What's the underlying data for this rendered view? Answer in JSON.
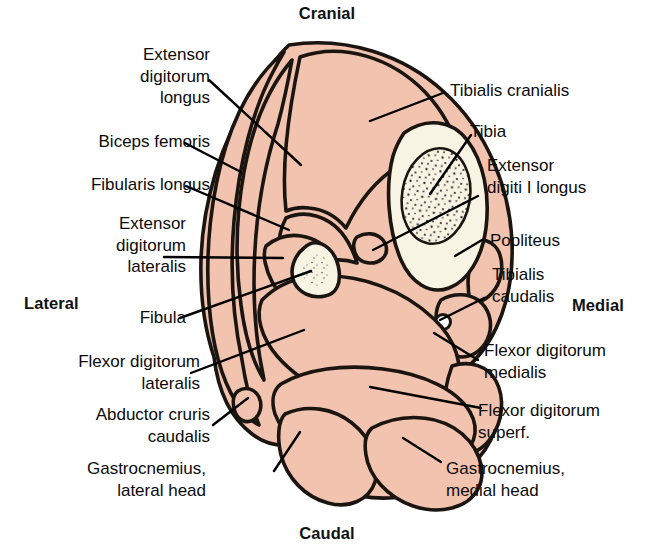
{
  "figure": {
    "kind": "anatomical-cross-section"
  },
  "orientation": {
    "cranial": "Cranial",
    "caudal": "Caudal",
    "lateral": "Lateral",
    "medial": "Medial"
  },
  "colors": {
    "muscle_fill": "#f2c3ae",
    "bone_cortex": "#f7f3e2",
    "bone_marrow": "#f7f3e2",
    "outline": "#1b1512",
    "background": "#ffffff",
    "text": "#0b0b0b",
    "leader_line": "#000000"
  },
  "labels_left": [
    {
      "id": "extensor-digitorum-longus",
      "text": "Extensor\ndigitorum\nlongus"
    },
    {
      "id": "biceps-femoris",
      "text": "Biceps femoris"
    },
    {
      "id": "fibularis-longus",
      "text": "Fibularis longus"
    },
    {
      "id": "extensor-digitorum-lateralis",
      "text": "Extensor\ndigitorum\nlateralis"
    },
    {
      "id": "fibula",
      "text": "Fibula"
    },
    {
      "id": "flexor-digitorum-lateralis",
      "text": "Flexor digitorum\nlateralis"
    },
    {
      "id": "abductor-cruris-caudalis",
      "text": "Abductor cruris\ncaudalis"
    },
    {
      "id": "gastrocnemius-lateral-head",
      "text": "Gastrocnemius,\nlateral head"
    }
  ],
  "labels_right": [
    {
      "id": "tibialis-cranialis",
      "text": "Tibialis cranialis"
    },
    {
      "id": "tibia",
      "text": "Tibia"
    },
    {
      "id": "extensor-digiti-i-longus",
      "text": "Extensor\ndigiti I longus"
    },
    {
      "id": "popliteus",
      "text": "Popliteus"
    },
    {
      "id": "tibialis-caudalis",
      "text": "Tibialis\ncaudalis"
    },
    {
      "id": "flexor-digitorum-medialis",
      "text": "Flexor digitorum\nmedialis"
    },
    {
      "id": "flexor-digitorum-superf",
      "text": "Flexor digitorum\nsuperf."
    },
    {
      "id": "gastrocnemius-medial-head",
      "text": "Gastrocnemius,\nmedial head"
    }
  ],
  "structures": [
    {
      "id": "tibia",
      "type": "bone",
      "side": "medial-cranial"
    },
    {
      "id": "fibula",
      "type": "bone",
      "side": "lateral-middle"
    },
    {
      "id": "tibialis-cranialis",
      "type": "muscle",
      "side": "cranial"
    },
    {
      "id": "extensor-digitorum-longus",
      "type": "muscle",
      "side": "craniolateral"
    },
    {
      "id": "biceps-femoris",
      "type": "muscle",
      "side": "lateral"
    },
    {
      "id": "fibularis-longus",
      "type": "muscle",
      "side": "lateral"
    },
    {
      "id": "extensor-digitorum-lateralis",
      "type": "muscle",
      "side": "lateral"
    },
    {
      "id": "flexor-digitorum-lateralis",
      "type": "muscle",
      "side": "caudolateral"
    },
    {
      "id": "abductor-cruris-caudalis",
      "type": "muscle",
      "side": "caudolateral"
    },
    {
      "id": "gastrocnemius-lateral-head",
      "type": "muscle",
      "side": "caudal"
    },
    {
      "id": "gastrocnemius-medial-head",
      "type": "muscle",
      "side": "caudal"
    },
    {
      "id": "flexor-digitorum-superf",
      "type": "muscle",
      "side": "caudal"
    },
    {
      "id": "flexor-digitorum-medialis",
      "type": "muscle",
      "side": "caudomedial"
    },
    {
      "id": "tibialis-caudalis",
      "type": "muscle",
      "side": "medial"
    },
    {
      "id": "popliteus",
      "type": "muscle",
      "side": "medial"
    },
    {
      "id": "extensor-digiti-i-longus",
      "type": "muscle",
      "side": "interosseous"
    }
  ]
}
